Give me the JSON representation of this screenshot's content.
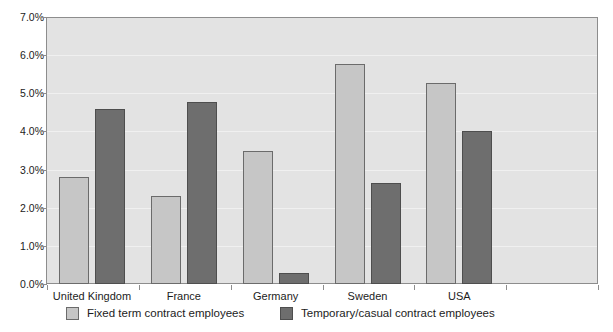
{
  "chart_data": {
    "type": "bar",
    "title": "",
    "xlabel": "",
    "ylabel": "",
    "categories": [
      "United Kingdom",
      "France",
      "Germany",
      "Sweden",
      "USA"
    ],
    "series": [
      {
        "name": "Fixed term contract employees",
        "color": "#c6c6c6",
        "values": [
          2.8,
          2.3,
          3.5,
          5.78,
          5.28
        ]
      },
      {
        "name": "Temporary/casual contract employees",
        "color": "#6e6e6e",
        "values": [
          4.58,
          4.77,
          0.3,
          2.64,
          4.0
        ]
      }
    ],
    "ylim": [
      0,
      7
    ],
    "ytick_labels": [
      "0.0%",
      "1.0%",
      "2.0%",
      "3.0%",
      "4.0%",
      "5.0%",
      "6.0%",
      "7.0%"
    ],
    "ytick_values": [
      0,
      1,
      2,
      3,
      4,
      5,
      6,
      7
    ],
    "grid": true,
    "legend_position": "bottom",
    "plot_background": "#e3e3e3",
    "axis_color": "#8d8d8d"
  }
}
